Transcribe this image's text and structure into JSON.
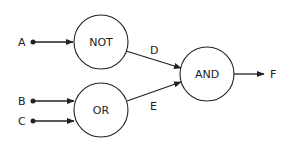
{
  "diagram": {
    "type": "logic-circuit",
    "inputs": [
      {
        "id": "A",
        "label": "A"
      },
      {
        "id": "B",
        "label": "B"
      },
      {
        "id": "C",
        "label": "C"
      }
    ],
    "gates": [
      {
        "id": "not",
        "label": "NOT",
        "inputs": [
          "A"
        ],
        "output": "D"
      },
      {
        "id": "or",
        "label": "OR",
        "inputs": [
          "B",
          "C"
        ],
        "output": "E"
      },
      {
        "id": "and",
        "label": "AND",
        "inputs": [
          "D",
          "E"
        ],
        "output": "F"
      }
    ],
    "wires": [
      {
        "id": "D",
        "label": "D"
      },
      {
        "id": "E",
        "label": "E"
      }
    ],
    "output": {
      "id": "F",
      "label": "F"
    },
    "colors": {
      "stroke": "#222222",
      "background": "#ffffff"
    }
  }
}
